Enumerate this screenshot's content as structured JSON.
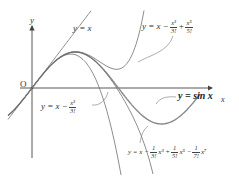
{
  "axes": {
    "x_label": "x",
    "y_label": "y",
    "origin_label": "O"
  },
  "labels": {
    "line": "y = x",
    "cubic_prefix": "y = x −",
    "cubic_num": "x³",
    "cubic_den": "3!",
    "quintic_prefix": "y = x −",
    "quintic_num1": "x³",
    "quintic_den1": "3!",
    "quintic_plus": "+",
    "quintic_num2": "x⁵",
    "quintic_den2": "5!",
    "sine": "y = sin x",
    "septic_prefix": "y = x −",
    "septic_den1": "3!",
    "septic_term1": "x³ +",
    "septic_den2": "5!",
    "septic_term2": "x⁵ −",
    "septic_den3": "7!",
    "septic_term3": "x⁷",
    "one": "1"
  },
  "colors": {
    "axis": "#444444",
    "curve": "#6e6e6e",
    "sine": "#8a8a8a",
    "text": "#333333"
  },
  "chart_data": {
    "type": "line",
    "title": "",
    "xlabel": "x",
    "ylabel": "y",
    "series": [
      {
        "name": "y = sin x",
        "expr": "sin(x)"
      },
      {
        "name": "y = x",
        "expr": "x"
      },
      {
        "name": "y = x − x³/3!",
        "expr": "x - x^3/6"
      },
      {
        "name": "y = x − x³/3! + x⁵/5!",
        "expr": "x - x^3/6 + x^5/120"
      },
      {
        "name": "y = x − (1/3!)x³ + (1/5!)x⁵ − (1/7!)x⁷",
        "expr": "x - x^3/6 + x^5/120 - x^7/5040"
      }
    ],
    "xlim": [
      -0.5,
      6.4
    ],
    "ylim": [
      -1.9,
      1.75
    ],
    "grid": false,
    "legend": "inline labels with leader lines"
  }
}
